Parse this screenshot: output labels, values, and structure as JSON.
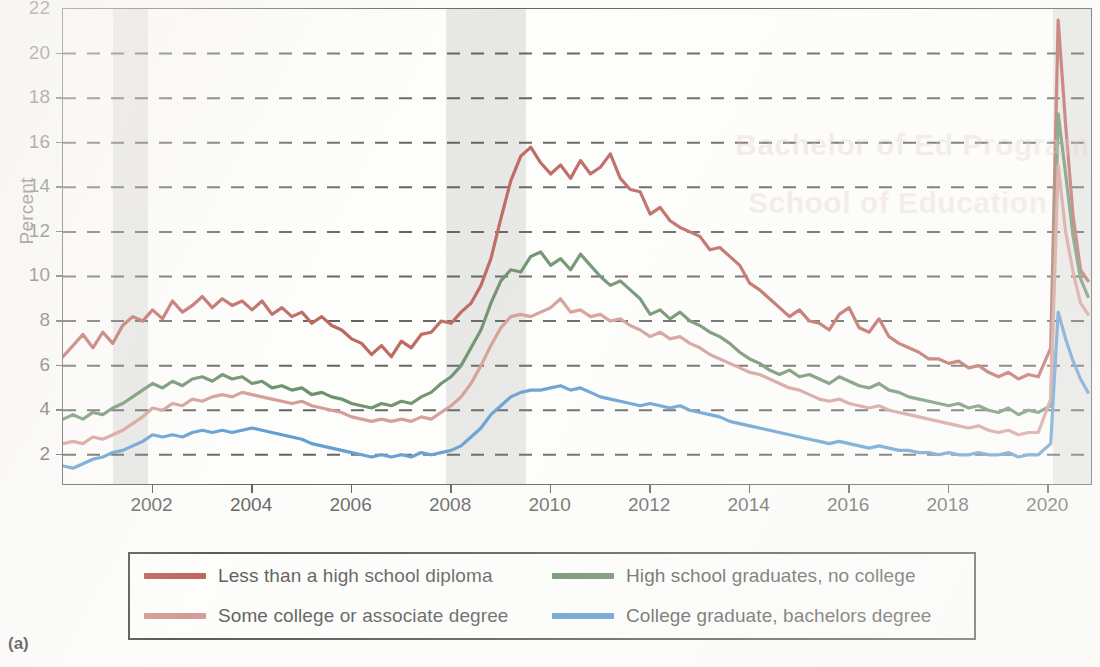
{
  "figure": {
    "panel_label": "(a)",
    "ylabel": "Percent"
  },
  "axes": {
    "y_ticks": [
      2,
      4,
      6,
      8,
      10,
      12,
      14,
      16,
      18,
      20,
      22
    ],
    "y_tick_labels": [
      "2",
      "4",
      "6",
      "8",
      "10",
      "12",
      "14",
      "16",
      "18",
      "20",
      "22"
    ],
    "x_ticks": [
      2002,
      2004,
      2006,
      2008,
      2010,
      2012,
      2014,
      2016,
      2018,
      2020
    ],
    "x_tick_labels": [
      "2002",
      "2004",
      "2006",
      "2008",
      "2010",
      "2012",
      "2014",
      "2016",
      "2018",
      "2020"
    ]
  },
  "legend": {
    "items": [
      {
        "label": "Less than a high school diploma",
        "color": "#a6342a"
      },
      {
        "label": "High school graduates, no college",
        "color": "#3c6b3c"
      },
      {
        "label": "Some college or associate degree",
        "color": "#c67b74"
      },
      {
        "label": "College graduate, bachelors degree",
        "color": "#2d7cc0"
      }
    ]
  },
  "colors": {
    "recession_band": "#dddddb",
    "gridline": "#2e2e2c",
    "axis": "#2e2e2c",
    "plot_background": "#fdfdfb",
    "page_background": "#fbfbf9"
  },
  "chart_data": {
    "type": "line",
    "title": "",
    "subtitle": "",
    "xlabel": "",
    "ylabel": "Percent",
    "xlim": [
      2000.2,
      2020.9
    ],
    "ylim": [
      0.6,
      22
    ],
    "grid": "horizontal-dashed",
    "legend_position": "below-plot",
    "annotations": [
      {
        "type": "shaded-band",
        "name": "recession-2001",
        "x_start": 2001.2,
        "x_end": 2001.9
      },
      {
        "type": "shaded-band",
        "name": "recession-2008",
        "x_start": 2007.9,
        "x_end": 2009.5
      },
      {
        "type": "shaded-band",
        "name": "recession-2020",
        "x_start": 2020.1,
        "x_end": 2020.9
      }
    ],
    "series": [
      {
        "name": "Less than a high school diploma",
        "color": "#a6342a",
        "x": [
          2000.2,
          2000.4,
          2000.6,
          2000.8,
          2001.0,
          2001.2,
          2001.4,
          2001.6,
          2001.8,
          2002.0,
          2002.2,
          2002.4,
          2002.6,
          2002.8,
          2003.0,
          2003.2,
          2003.4,
          2003.6,
          2003.8,
          2004.0,
          2004.2,
          2004.4,
          2004.6,
          2004.8,
          2005.0,
          2005.2,
          2005.4,
          2005.6,
          2005.8,
          2006.0,
          2006.2,
          2006.4,
          2006.6,
          2006.8,
          2007.0,
          2007.2,
          2007.4,
          2007.6,
          2007.8,
          2008.0,
          2008.2,
          2008.4,
          2008.6,
          2008.8,
          2009.0,
          2009.2,
          2009.4,
          2009.6,
          2009.8,
          2010.0,
          2010.2,
          2010.4,
          2010.6,
          2010.8,
          2011.0,
          2011.2,
          2011.4,
          2011.6,
          2011.8,
          2012.0,
          2012.2,
          2012.4,
          2012.6,
          2012.8,
          2013.0,
          2013.2,
          2013.4,
          2013.6,
          2013.8,
          2014.0,
          2014.2,
          2014.4,
          2014.6,
          2014.8,
          2015.0,
          2015.2,
          2015.4,
          2015.6,
          2015.8,
          2016.0,
          2016.2,
          2016.4,
          2016.6,
          2016.8,
          2017.0,
          2017.2,
          2017.4,
          2017.6,
          2017.8,
          2018.0,
          2018.2,
          2018.4,
          2018.6,
          2018.8,
          2019.0,
          2019.2,
          2019.4,
          2019.6,
          2019.8,
          2020.05,
          2020.2,
          2020.35,
          2020.5,
          2020.65,
          2020.8
        ],
        "y": [
          6.4,
          6.9,
          7.4,
          6.8,
          7.5,
          7.0,
          7.8,
          8.2,
          8.0,
          8.5,
          8.1,
          8.9,
          8.4,
          8.7,
          9.1,
          8.6,
          9.0,
          8.7,
          8.9,
          8.5,
          8.9,
          8.3,
          8.6,
          8.2,
          8.4,
          7.9,
          8.2,
          7.8,
          7.6,
          7.2,
          7.0,
          6.5,
          6.9,
          6.4,
          7.1,
          6.8,
          7.4,
          7.5,
          8.0,
          7.9,
          8.4,
          8.8,
          9.6,
          10.8,
          12.6,
          14.3,
          15.4,
          15.8,
          15.1,
          14.6,
          15.0,
          14.4,
          15.2,
          14.6,
          14.9,
          15.5,
          14.4,
          13.9,
          13.8,
          12.8,
          13.1,
          12.5,
          12.2,
          12.0,
          11.8,
          11.2,
          11.3,
          10.9,
          10.5,
          9.7,
          9.4,
          9.0,
          8.6,
          8.2,
          8.5,
          8.0,
          7.9,
          7.6,
          8.3,
          8.6,
          7.7,
          7.5,
          8.1,
          7.3,
          7.0,
          6.8,
          6.6,
          6.3,
          6.3,
          6.1,
          6.2,
          5.9,
          6.0,
          5.7,
          5.5,
          5.7,
          5.4,
          5.6,
          5.5,
          6.8,
          21.5,
          16.8,
          12.7,
          10.3,
          9.8
        ]
      },
      {
        "name": "High school graduates, no college",
        "color": "#3c6b3c",
        "x": [
          2000.2,
          2000.4,
          2000.6,
          2000.8,
          2001.0,
          2001.2,
          2001.4,
          2001.6,
          2001.8,
          2002.0,
          2002.2,
          2002.4,
          2002.6,
          2002.8,
          2003.0,
          2003.2,
          2003.4,
          2003.6,
          2003.8,
          2004.0,
          2004.2,
          2004.4,
          2004.6,
          2004.8,
          2005.0,
          2005.2,
          2005.4,
          2005.6,
          2005.8,
          2006.0,
          2006.2,
          2006.4,
          2006.6,
          2006.8,
          2007.0,
          2007.2,
          2007.4,
          2007.6,
          2007.8,
          2008.0,
          2008.2,
          2008.4,
          2008.6,
          2008.8,
          2009.0,
          2009.2,
          2009.4,
          2009.6,
          2009.8,
          2010.0,
          2010.2,
          2010.4,
          2010.6,
          2010.8,
          2011.0,
          2011.2,
          2011.4,
          2011.6,
          2011.8,
          2012.0,
          2012.2,
          2012.4,
          2012.6,
          2012.8,
          2013.0,
          2013.2,
          2013.4,
          2013.6,
          2013.8,
          2014.0,
          2014.2,
          2014.4,
          2014.6,
          2014.8,
          2015.0,
          2015.2,
          2015.4,
          2015.6,
          2015.8,
          2016.0,
          2016.2,
          2016.4,
          2016.6,
          2016.8,
          2017.0,
          2017.2,
          2017.4,
          2017.6,
          2017.8,
          2018.0,
          2018.2,
          2018.4,
          2018.6,
          2018.8,
          2019.0,
          2019.2,
          2019.4,
          2019.6,
          2019.8,
          2020.05,
          2020.2,
          2020.35,
          2020.5,
          2020.65,
          2020.8
        ],
        "y": [
          3.6,
          3.8,
          3.6,
          3.9,
          3.8,
          4.1,
          4.3,
          4.6,
          4.9,
          5.2,
          5.0,
          5.3,
          5.1,
          5.4,
          5.5,
          5.3,
          5.6,
          5.4,
          5.5,
          5.2,
          5.3,
          5.0,
          5.1,
          4.9,
          5.0,
          4.7,
          4.8,
          4.6,
          4.5,
          4.3,
          4.2,
          4.1,
          4.3,
          4.2,
          4.4,
          4.3,
          4.6,
          4.8,
          5.2,
          5.5,
          6.0,
          6.8,
          7.6,
          8.8,
          9.8,
          10.3,
          10.2,
          10.9,
          11.1,
          10.5,
          10.8,
          10.3,
          11.0,
          10.5,
          10.0,
          9.6,
          9.8,
          9.4,
          9.0,
          8.3,
          8.5,
          8.1,
          8.4,
          8.0,
          7.8,
          7.5,
          7.3,
          7.0,
          6.6,
          6.3,
          6.1,
          5.8,
          5.6,
          5.8,
          5.5,
          5.6,
          5.4,
          5.2,
          5.5,
          5.3,
          5.1,
          5.0,
          5.2,
          4.9,
          4.8,
          4.6,
          4.5,
          4.4,
          4.3,
          4.2,
          4.3,
          4.1,
          4.2,
          4.0,
          3.9,
          4.1,
          3.8,
          4.0,
          3.9,
          4.2,
          17.3,
          14.6,
          11.8,
          9.9,
          9.1
        ]
      },
      {
        "name": "Some college or associate degree",
        "color": "#c67b74",
        "x": [
          2000.2,
          2000.4,
          2000.6,
          2000.8,
          2001.0,
          2001.2,
          2001.4,
          2001.6,
          2001.8,
          2002.0,
          2002.2,
          2002.4,
          2002.6,
          2002.8,
          2003.0,
          2003.2,
          2003.4,
          2003.6,
          2003.8,
          2004.0,
          2004.2,
          2004.4,
          2004.6,
          2004.8,
          2005.0,
          2005.2,
          2005.4,
          2005.6,
          2005.8,
          2006.0,
          2006.2,
          2006.4,
          2006.6,
          2006.8,
          2007.0,
          2007.2,
          2007.4,
          2007.6,
          2007.8,
          2008.0,
          2008.2,
          2008.4,
          2008.6,
          2008.8,
          2009.0,
          2009.2,
          2009.4,
          2009.6,
          2009.8,
          2010.0,
          2010.2,
          2010.4,
          2010.6,
          2010.8,
          2011.0,
          2011.2,
          2011.4,
          2011.6,
          2011.8,
          2012.0,
          2012.2,
          2012.4,
          2012.6,
          2012.8,
          2013.0,
          2013.2,
          2013.4,
          2013.6,
          2013.8,
          2014.0,
          2014.2,
          2014.4,
          2014.6,
          2014.8,
          2015.0,
          2015.2,
          2015.4,
          2015.6,
          2015.8,
          2016.0,
          2016.2,
          2016.4,
          2016.6,
          2016.8,
          2017.0,
          2017.2,
          2017.4,
          2017.6,
          2017.8,
          2018.0,
          2018.2,
          2018.4,
          2018.6,
          2018.8,
          2019.0,
          2019.2,
          2019.4,
          2019.6,
          2019.8,
          2020.05,
          2020.2,
          2020.35,
          2020.5,
          2020.65,
          2020.8
        ],
        "y": [
          2.5,
          2.6,
          2.5,
          2.8,
          2.7,
          2.9,
          3.1,
          3.4,
          3.7,
          4.1,
          4.0,
          4.3,
          4.2,
          4.5,
          4.4,
          4.6,
          4.7,
          4.6,
          4.8,
          4.7,
          4.6,
          4.5,
          4.4,
          4.3,
          4.4,
          4.2,
          4.1,
          4.0,
          3.9,
          3.7,
          3.6,
          3.5,
          3.6,
          3.5,
          3.6,
          3.5,
          3.7,
          3.6,
          3.9,
          4.2,
          4.6,
          5.2,
          6.0,
          6.9,
          7.7,
          8.2,
          8.3,
          8.2,
          8.4,
          8.6,
          9.0,
          8.4,
          8.5,
          8.2,
          8.3,
          8.0,
          8.1,
          7.8,
          7.6,
          7.3,
          7.5,
          7.2,
          7.3,
          7.0,
          6.8,
          6.5,
          6.3,
          6.1,
          5.9,
          5.7,
          5.6,
          5.4,
          5.2,
          5.0,
          4.9,
          4.7,
          4.5,
          4.4,
          4.5,
          4.3,
          4.2,
          4.1,
          4.2,
          4.0,
          3.9,
          3.8,
          3.7,
          3.6,
          3.5,
          3.4,
          3.3,
          3.2,
          3.3,
          3.1,
          3.0,
          3.1,
          2.9,
          3.0,
          3.0,
          4.5,
          15.0,
          12.0,
          10.2,
          8.8,
          8.3
        ]
      },
      {
        "name": "College graduate, bachelors degree",
        "color": "#2d7cc0",
        "x": [
          2000.2,
          2000.4,
          2000.6,
          2000.8,
          2001.0,
          2001.2,
          2001.4,
          2001.6,
          2001.8,
          2002.0,
          2002.2,
          2002.4,
          2002.6,
          2002.8,
          2003.0,
          2003.2,
          2003.4,
          2003.6,
          2003.8,
          2004.0,
          2004.2,
          2004.4,
          2004.6,
          2004.8,
          2005.0,
          2005.2,
          2005.4,
          2005.6,
          2005.8,
          2006.0,
          2006.2,
          2006.4,
          2006.6,
          2006.8,
          2007.0,
          2007.2,
          2007.4,
          2007.6,
          2007.8,
          2008.0,
          2008.2,
          2008.4,
          2008.6,
          2008.8,
          2009.0,
          2009.2,
          2009.4,
          2009.6,
          2009.8,
          2010.0,
          2010.2,
          2010.4,
          2010.6,
          2010.8,
          2011.0,
          2011.2,
          2011.4,
          2011.6,
          2011.8,
          2012.0,
          2012.2,
          2012.4,
          2012.6,
          2012.8,
          2013.0,
          2013.2,
          2013.4,
          2013.6,
          2013.8,
          2014.0,
          2014.2,
          2014.4,
          2014.6,
          2014.8,
          2015.0,
          2015.2,
          2015.4,
          2015.6,
          2015.8,
          2016.0,
          2016.2,
          2016.4,
          2016.6,
          2016.8,
          2017.0,
          2017.2,
          2017.4,
          2017.6,
          2017.8,
          2018.0,
          2018.2,
          2018.4,
          2018.6,
          2018.8,
          2019.0,
          2019.2,
          2019.4,
          2019.6,
          2019.8,
          2020.05,
          2020.2,
          2020.35,
          2020.5,
          2020.65,
          2020.8
        ],
        "y": [
          1.5,
          1.4,
          1.6,
          1.8,
          1.9,
          2.1,
          2.2,
          2.4,
          2.6,
          2.9,
          2.8,
          2.9,
          2.8,
          3.0,
          3.1,
          3.0,
          3.1,
          3.0,
          3.1,
          3.2,
          3.1,
          3.0,
          2.9,
          2.8,
          2.7,
          2.5,
          2.4,
          2.3,
          2.2,
          2.1,
          2.0,
          1.9,
          2.0,
          1.9,
          2.0,
          1.9,
          2.1,
          2.0,
          2.1,
          2.2,
          2.4,
          2.8,
          3.2,
          3.8,
          4.2,
          4.6,
          4.8,
          4.9,
          4.9,
          5.0,
          5.1,
          4.9,
          5.0,
          4.8,
          4.6,
          4.5,
          4.4,
          4.3,
          4.2,
          4.3,
          4.2,
          4.1,
          4.2,
          4.0,
          3.9,
          3.8,
          3.7,
          3.5,
          3.4,
          3.3,
          3.2,
          3.1,
          3.0,
          2.9,
          2.8,
          2.7,
          2.6,
          2.5,
          2.6,
          2.5,
          2.4,
          2.3,
          2.4,
          2.3,
          2.2,
          2.2,
          2.1,
          2.1,
          2.0,
          2.1,
          2.0,
          2.0,
          2.1,
          2.0,
          2.0,
          2.1,
          1.9,
          2.0,
          2.0,
          2.5,
          8.4,
          7.2,
          6.2,
          5.4,
          4.8
        ]
      }
    ]
  }
}
